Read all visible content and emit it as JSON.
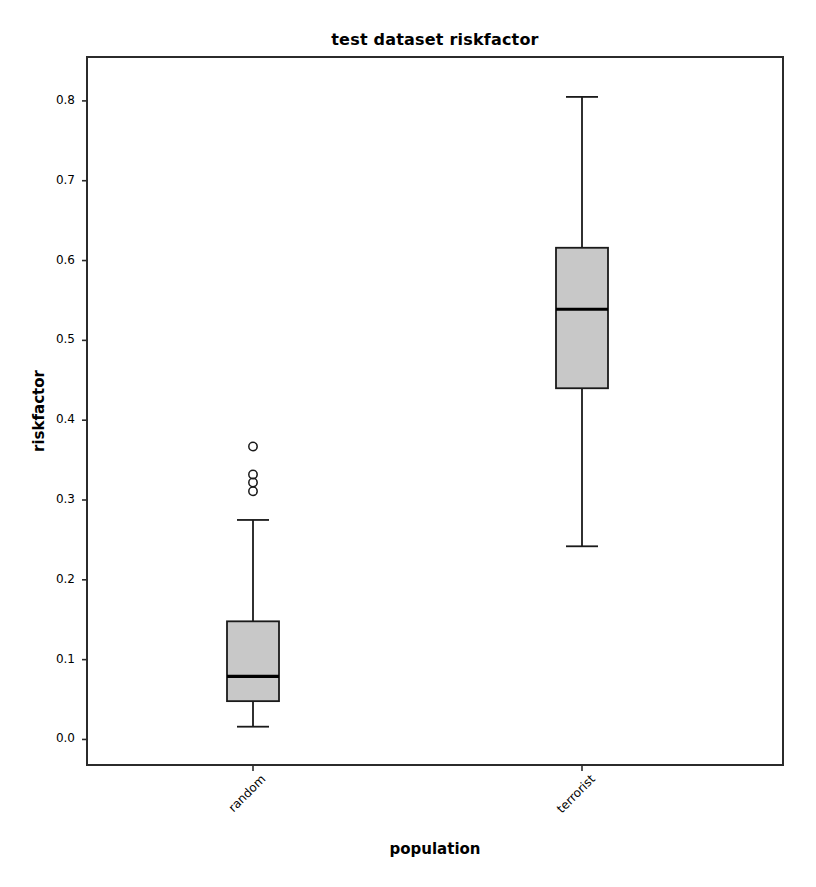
{
  "chart_data": {
    "type": "box",
    "title": "test dataset riskfactor",
    "xlabel": "population",
    "ylabel": "riskfactor",
    "categories": [
      "random",
      "terrorist"
    ],
    "ytick_labels": [
      "0.0",
      "0.1",
      "0.2",
      "0.3",
      "0.4",
      "0.5",
      "0.6",
      "0.7",
      "0.8"
    ],
    "ytick_values": [
      0.0,
      0.1,
      0.2,
      0.3,
      0.4,
      0.5,
      0.6,
      0.7,
      0.8
    ],
    "ylim": [
      -0.032,
      0.855
    ],
    "grid": false,
    "legend": false,
    "box_facecolor": "#c8c8c8",
    "box_edgecolor": "#1a1a1a",
    "median_color": "#000000",
    "whisker_color": "#1a1a1a",
    "flier_color": "#1a1a1a",
    "boxes": [
      {
        "label": "random",
        "whisker_low": 0.016,
        "q1": 0.048,
        "median": 0.079,
        "q3": 0.148,
        "whisker_high": 0.275,
        "outliers": [
          0.367,
          0.332,
          0.322,
          0.311
        ]
      },
      {
        "label": "terrorist",
        "whisker_low": 0.242,
        "q1": 0.44,
        "median": 0.539,
        "q3": 0.616,
        "whisker_high": 0.805,
        "outliers": []
      }
    ]
  },
  "axes": {
    "frame_color": "#2b2b2b"
  }
}
